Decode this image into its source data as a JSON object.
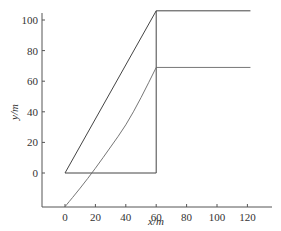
{
  "chart_data": {
    "type": "line",
    "title": "",
    "xlabel": "x/m",
    "ylabel": "y/m",
    "xlim": [
      -15,
      138
    ],
    "ylim": [
      -22,
      108
    ],
    "xticks": [
      0,
      20,
      40,
      60,
      80,
      100,
      120
    ],
    "yticks": [
      0,
      20,
      40,
      60,
      80,
      100
    ],
    "grid": false,
    "legend": null,
    "series": [
      {
        "name": "outer-path",
        "style": "solid",
        "x": [
          0,
          60,
          60,
          122,
          60,
          60,
          0
        ],
        "y": [
          0,
          0,
          106,
          106,
          106,
          0,
          0
        ],
        "points": [
          [
            0,
            0
          ],
          [
            60,
            106
          ],
          [
            122,
            106
          ]
        ],
        "closing_segment": [
          [
            60,
            106
          ],
          [
            60,
            0
          ],
          [
            0,
            0
          ]
        ]
      },
      {
        "name": "inner-curve",
        "style": "solid-thin",
        "x": [
          0,
          10,
          20,
          30,
          40,
          50,
          60,
          122
        ],
        "y": [
          -22,
          -10,
          3,
          17,
          31,
          49,
          69,
          69
        ]
      }
    ]
  },
  "axes": {
    "xlabel": "x/m",
    "ylabel": "y/m",
    "xtick_labels": [
      "0",
      "20",
      "40",
      "60",
      "80",
      "100",
      "120"
    ],
    "ytick_labels": [
      "0",
      "20",
      "40",
      "60",
      "80",
      "100"
    ]
  }
}
